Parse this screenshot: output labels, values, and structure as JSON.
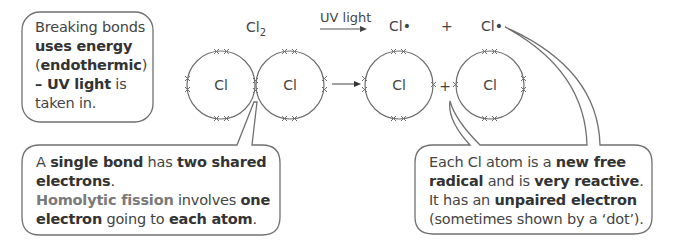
{
  "reaction": {
    "reactant_formula": "Cl",
    "reactant_subscript": "2",
    "condition": "UV light",
    "product_1": "Cl•",
    "plus": "+",
    "product_2": "Cl•"
  },
  "atoms": {
    "molecule_left": "Cl",
    "molecule_right": "Cl",
    "radical_left": "Cl",
    "radical_right": "Cl",
    "plus": "+"
  },
  "callouts": {
    "endothermic": {
      "segments": [
        {
          "text": "Breaking bonds",
          "style": "normal"
        },
        {
          "text": "uses energy",
          "style": "bold"
        },
        {
          "text": "(",
          "style": "normal"
        },
        {
          "text": "endothermic",
          "style": "bold"
        },
        {
          "text": ")",
          "style": "normal"
        },
        {
          "text": "– UV light",
          "style": "bold"
        },
        {
          "text": " is taken in.",
          "style": "normal"
        }
      ]
    },
    "single_bond": {
      "line1_a": "A ",
      "line1_b": "single bond",
      "line1_c": " has ",
      "line1_d": "two shared electrons",
      "line1_e": ".",
      "line2_a": "Homolytic fission",
      "line2_b": " involves ",
      "line2_c": "one electron",
      "line2_d": " going to ",
      "line2_e": "each atom",
      "line2_f": "."
    },
    "free_radical": {
      "a": "Each Cl atom is a ",
      "b": "new free radical",
      "c": " and is ",
      "d": "very reactive",
      "e": ". It has an ",
      "f": "unpaired electron",
      "g": " (sometimes shown by a ‘dot’)."
    }
  },
  "colors": {
    "line": "#6e6e6e",
    "text": "#444444",
    "keyword_highlight": "#7a7a7a"
  }
}
